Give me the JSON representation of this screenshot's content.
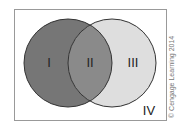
{
  "diagram": {
    "type": "venn",
    "regions": [
      {
        "id": "I",
        "label": "I",
        "color": "#767676"
      },
      {
        "id": "II",
        "label": "II",
        "color": "#8a8a8a"
      },
      {
        "id": "III",
        "label": "III",
        "color": "#dedede"
      },
      {
        "id": "IV",
        "label": "IV",
        "color": "#ffffff"
      }
    ],
    "credit": "© Cengage Learning 2014"
  }
}
